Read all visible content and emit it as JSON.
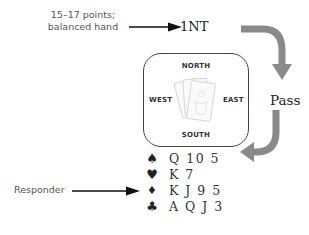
{
  "annotations": {
    "opener_line1": "15–17 points;",
    "opener_line2": "balanced hand",
    "responder": "Responder"
  },
  "auction": {
    "opening_bid": "1NT",
    "next_bid": "Pass"
  },
  "table": {
    "north": "NORTH",
    "south": "SOUTH",
    "east": "EAST",
    "west": "WEST",
    "center_icon": "playing-cards-icon"
  },
  "hand": {
    "rows": [
      {
        "suit": "spades",
        "symbol": "♠",
        "cards": "Q 10 5"
      },
      {
        "suit": "hearts",
        "symbol": "♥",
        "cards": "K 7"
      },
      {
        "suit": "diamonds",
        "symbol": "♦",
        "cards": "K J 9 5"
      },
      {
        "suit": "clubs",
        "symbol": "♣",
        "cards": "A Q J 3"
      }
    ]
  },
  "colors": {
    "curved_arrow": "#8a8a8a",
    "pointer_arrow": "#111111",
    "text": "#333333"
  }
}
